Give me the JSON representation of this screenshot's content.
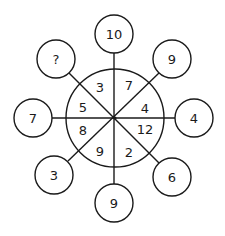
{
  "puzzle": {
    "center": {
      "x": 115,
      "y": 118,
      "r": 49
    },
    "outer_radius": 19,
    "inner_sectors": [
      {
        "position": "top-left",
        "value": "3",
        "x": 100,
        "y": 87
      },
      {
        "position": "top-right",
        "value": "7",
        "x": 129,
        "y": 85
      },
      {
        "position": "right-upper",
        "value": "4",
        "x": 145,
        "y": 108
      },
      {
        "position": "right-lower",
        "value": "12",
        "x": 145,
        "y": 129
      },
      {
        "position": "bottom-right",
        "value": "2",
        "x": 129,
        "y": 152
      },
      {
        "position": "bottom-left",
        "value": "9",
        "x": 100,
        "y": 151
      },
      {
        "position": "left-lower",
        "value": "8",
        "x": 83,
        "y": 130
      },
      {
        "position": "left-upper",
        "value": "5",
        "x": 83,
        "y": 107
      }
    ],
    "outer_circles": [
      {
        "position": "top",
        "value": "10",
        "x": 114,
        "y": 34
      },
      {
        "position": "top-right",
        "value": "9",
        "x": 172,
        "y": 59
      },
      {
        "position": "right",
        "value": "4",
        "x": 194,
        "y": 118
      },
      {
        "position": "bottom-right",
        "value": "6",
        "x": 172,
        "y": 177
      },
      {
        "position": "bottom",
        "value": "9",
        "x": 114,
        "y": 203
      },
      {
        "position": "bottom-left",
        "value": "3",
        "x": 54,
        "y": 175
      },
      {
        "position": "left",
        "value": "7",
        "x": 33,
        "y": 118
      },
      {
        "position": "top-left",
        "value": "?",
        "x": 56,
        "y": 59
      }
    ]
  }
}
